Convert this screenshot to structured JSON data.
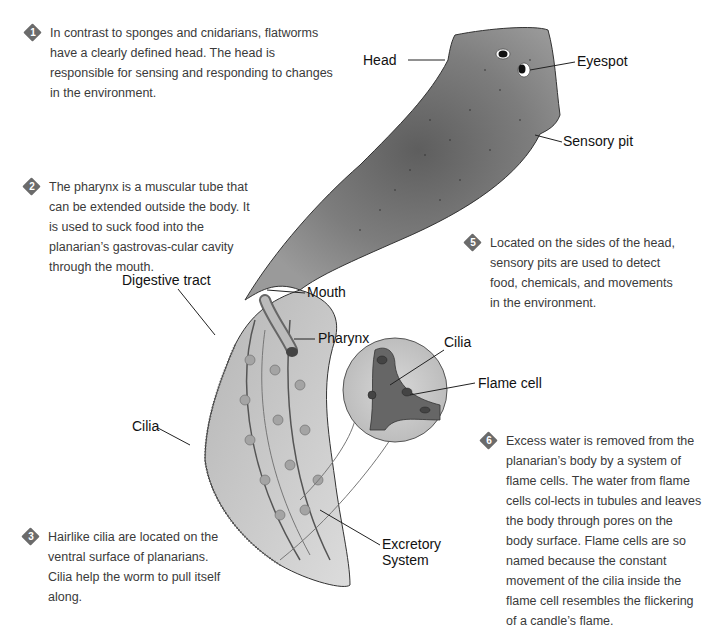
{
  "notes": [
    {
      "number": "1",
      "text": "In contrast to sponges and cnidarians, flatworms have a clearly defined head. The head is responsible for sensing and responding to changes in the environment."
    },
    {
      "number": "2",
      "text": "The pharynx is a muscular tube that can be extended outside the body. It is used to suck food into the planarian’s gastrovas-cular cavity through the mouth."
    },
    {
      "number": "3",
      "text": "Hairlike cilia are located on the ventral surface of planarians. Cilia help the worm to pull itself along."
    },
    {
      "number": "5",
      "text": "Located on the sides of the head, sensory pits are used to detect food, chemicals, and movements in the environment."
    },
    {
      "number": "6",
      "text": "Excess water is removed from the planarian’s body by a system of flame cells. The water from flame cells col-lects in tubules and leaves the body through pores on the body surface. Flame cells are so named because the constant movement of the cilia inside the flame cell resembles the flickering of a candle’s flame."
    }
  ],
  "labels": {
    "head": "Head",
    "eyespot": "Eyespot",
    "sensory_pit": "Sensory pit",
    "digestive_tract": "Digestive tract",
    "mouth": "Mouth",
    "pharynx": "Pharynx",
    "cilia_inset": "Cilia",
    "flame_cell": "Flame cell",
    "cilia_body": "Cilia",
    "excretory_line1": "Excretory",
    "excretory_line2": "System"
  },
  "colors": {
    "body": "#8e8e8e",
    "body_dark": "#5a5a5a",
    "underside": "#c9c9c9",
    "badge": "#6b6b6b"
  }
}
